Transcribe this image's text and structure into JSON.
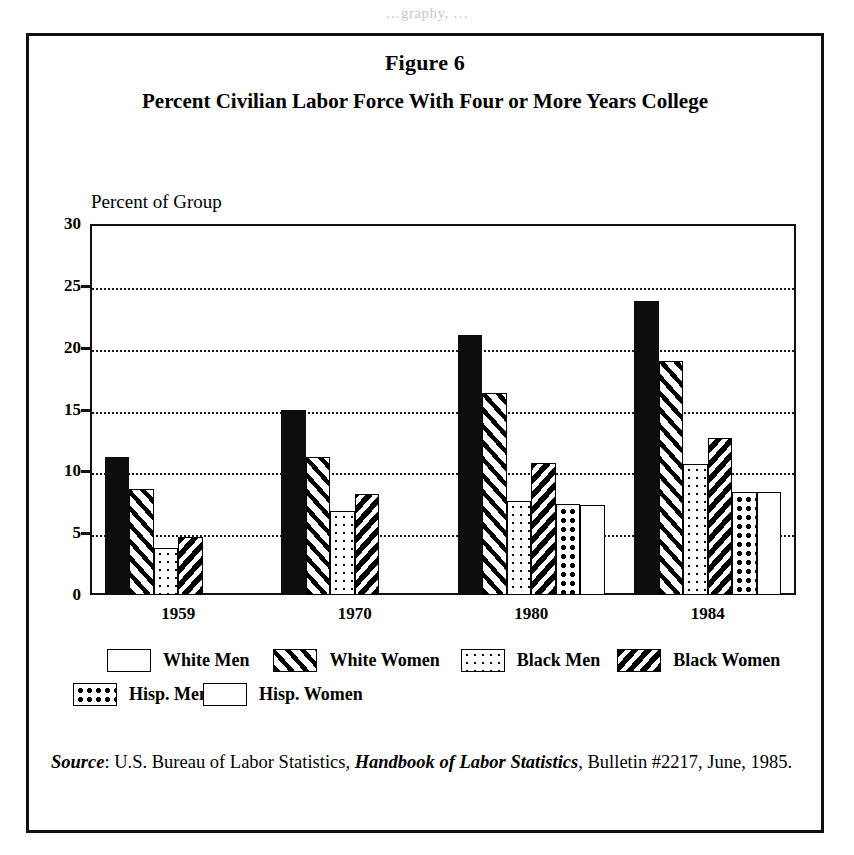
{
  "bleed_text": "…graphy, …",
  "figure": {
    "number": "Figure 6",
    "title": "Percent Civilian Labor Force With Four or More Years College",
    "axis_caption": "Percent of Group"
  },
  "source": {
    "label": "Source",
    "colon": ": ",
    "agency": "U.S. Bureau of Labor Statistics, ",
    "publication": "Handbook of Labor Statistics",
    "rest": ", Bulletin #2217, June, 1985."
  },
  "legend": {
    "rows": [
      [
        {
          "label": "White Men",
          "pattern": "solid"
        },
        {
          "label": "White Women",
          "pattern": "diag-wide"
        },
        {
          "label": "Black Men",
          "pattern": "dots-light"
        },
        {
          "label": "Black Women",
          "pattern": "diag-dense"
        }
      ],
      [
        {
          "label": "Hisp. Men",
          "pattern": "dots-bold"
        },
        {
          "label": "Hisp. Women",
          "pattern": "empty"
        }
      ]
    ]
  },
  "chart_data": {
    "type": "bar",
    "title": "Percent Civilian Labor Force With Four or More Years College",
    "subtitle": "Figure 6",
    "xlabel": "",
    "ylabel": "Percent of Group",
    "ylim": [
      0,
      30
    ],
    "yticks": [
      0,
      5,
      10,
      15,
      20,
      25,
      30
    ],
    "grid": true,
    "legend_position": "below",
    "categories": [
      "1959",
      "1970",
      "1980",
      "1984"
    ],
    "series": [
      {
        "name": "White Men",
        "pattern": "solid",
        "values": [
          11.2,
          15.0,
          21.0,
          23.8
        ]
      },
      {
        "name": "White Women",
        "pattern": "diag-wide",
        "values": [
          8.6,
          11.2,
          16.3,
          18.9
        ]
      },
      {
        "name": "Black Men",
        "pattern": "dots-light",
        "values": [
          3.8,
          6.8,
          7.6,
          10.6
        ]
      },
      {
        "name": "Black Women",
        "pattern": "diag-dense",
        "values": [
          4.7,
          8.2,
          10.7,
          12.7
        ]
      },
      {
        "name": "Hisp. Men",
        "pattern": "dots-bold",
        "values": [
          null,
          null,
          7.4,
          8.3
        ]
      },
      {
        "name": "Hisp. Women",
        "pattern": "empty",
        "values": [
          null,
          null,
          7.3,
          8.3
        ]
      }
    ]
  }
}
